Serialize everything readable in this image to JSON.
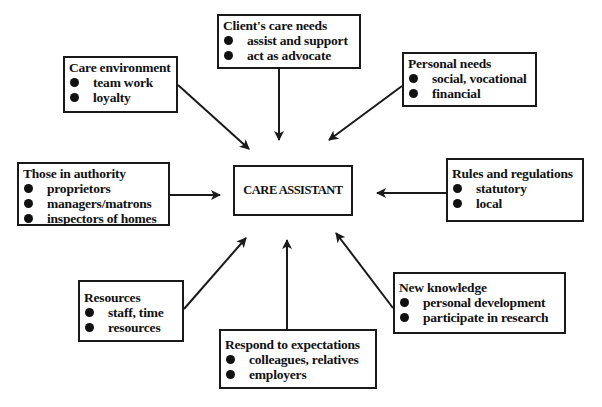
{
  "center": {
    "label": "CARE ASSISTANT"
  },
  "boxes": {
    "client": {
      "title": "Client's care needs",
      "items": [
        "assist and support",
        "act as advocate"
      ]
    },
    "environment": {
      "title": "Care environment",
      "items": [
        "team work",
        "loyalty"
      ]
    },
    "personal": {
      "title": "Personal needs",
      "items": [
        "social, vocational",
        "financial"
      ]
    },
    "authority": {
      "title": "Those in authority",
      "items": [
        "proprietors",
        "managers/matrons",
        "inspectors of homes"
      ]
    },
    "rules": {
      "title": "Rules and regulations",
      "items": [
        "statutory",
        "local"
      ]
    },
    "resources": {
      "title": "Resources",
      "items": [
        "staff, time",
        "resources"
      ]
    },
    "respond": {
      "title": "Respond to expectations",
      "items": [
        "colleagues, relatives",
        "employers"
      ]
    },
    "knowledge": {
      "title": "New knowledge",
      "items": [
        "personal development",
        "participate in research"
      ]
    }
  },
  "colors": {
    "line": "#1a1a1a",
    "background": "#ffffff"
  }
}
